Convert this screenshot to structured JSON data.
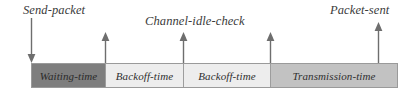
{
  "figure": {
    "type": "timing-diagram",
    "background_color": "#ffffff",
    "annotations": [
      {
        "id": "send-packet",
        "label": "Send-packet",
        "label_x": 23,
        "label_y": 3,
        "arrow_x": 31,
        "arrow_top": 18,
        "arrow_bottom": 63,
        "direction": "down",
        "color": "#6e6e6e"
      },
      {
        "id": "backoff-start",
        "label": "",
        "arrow_x": 105,
        "arrow_top": 32,
        "arrow_bottom": 63,
        "direction": "up",
        "color": "#6e6e6e"
      },
      {
        "id": "channel-idle-check",
        "label": "Channel-idle-check",
        "label_x": 145,
        "label_y": 14,
        "arrow_x": 183,
        "arrow_top": 32,
        "arrow_bottom": 63,
        "direction": "up",
        "color": "#6e6e6e"
      },
      {
        "id": "transmission-start",
        "label": "",
        "arrow_x": 270,
        "arrow_top": 32,
        "arrow_bottom": 63,
        "direction": "up",
        "color": "#6e6e6e"
      },
      {
        "id": "packet-sent",
        "label": "Packet-sent",
        "label_x": 330,
        "label_y": 3,
        "arrow_x": 378,
        "arrow_top": 22,
        "arrow_bottom": 63,
        "direction": "up",
        "color": "#6e6e6e"
      }
    ],
    "timeline": {
      "x": 31,
      "y": 63,
      "width": 367,
      "height": 25,
      "border_color": "#9a9a9a",
      "segments": [
        {
          "id": "waiting-time",
          "label": "Waiting-time",
          "width_px": 74,
          "fill": "#7e7e7e",
          "shade": "dark"
        },
        {
          "id": "backoff-time-1",
          "label": "Backoff-time",
          "width_px": 78,
          "fill": "#ededed",
          "shade": "light"
        },
        {
          "id": "backoff-time-2",
          "label": "Backoff-time",
          "width_px": 87,
          "fill": "#ededed",
          "shade": "light"
        },
        {
          "id": "transmission-time",
          "label": "Transmission-time",
          "width_px": 128,
          "fill": "#c2c2c2",
          "shade": "medium"
        }
      ]
    }
  }
}
